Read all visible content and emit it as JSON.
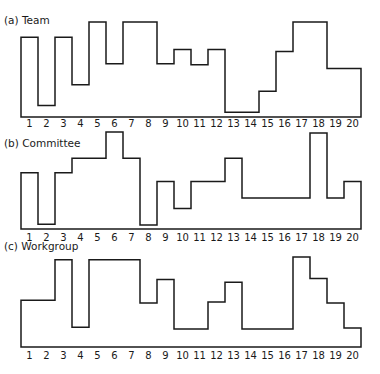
{
  "chart_data": [
    {
      "type": "bar",
      "style": "step-histogram",
      "title": "(a)  Team",
      "categories": [
        "1",
        "2",
        "3",
        "4",
        "5",
        "6",
        "7",
        "8",
        "9",
        "10",
        "11",
        "12",
        "13",
        "14",
        "15",
        "16",
        "17",
        "18",
        "19",
        "20"
      ],
      "values": [
        84,
        12,
        84,
        34,
        100,
        56,
        100,
        100,
        56,
        71,
        55,
        71,
        5,
        5,
        27,
        69,
        100,
        100,
        51,
        51
      ],
      "ylim": [
        0,
        100
      ],
      "xlabel": "",
      "ylabel": "",
      "grid": false,
      "layout": {
        "top": 22,
        "baseline": 117,
        "title_y": 24,
        "tick_y": 127
      }
    },
    {
      "type": "bar",
      "style": "step-histogram",
      "title": "(b)  Committee",
      "categories": [
        "1",
        "2",
        "3",
        "4",
        "5",
        "6",
        "7",
        "8",
        "9",
        "10",
        "11",
        "12",
        "13",
        "14",
        "15",
        "16",
        "17",
        "18",
        "19",
        "20"
      ],
      "values": [
        58,
        5,
        58,
        73,
        73,
        100,
        73,
        4,
        49,
        21,
        49,
        49,
        73,
        32,
        32,
        32,
        32,
        99,
        32,
        49
      ],
      "ylim": [
        0,
        100
      ],
      "xlabel": "",
      "ylabel": "",
      "grid": false,
      "layout": {
        "top": 132,
        "baseline": 229,
        "title_y": 147,
        "tick_y": 241
      }
    },
    {
      "type": "bar",
      "style": "step-histogram",
      "title": "(c)  Workgroup",
      "categories": [
        "1",
        "2",
        "3",
        "4",
        "5",
        "6",
        "7",
        "8",
        "9",
        "10",
        "11",
        "12",
        "13",
        "14",
        "15",
        "16",
        "17",
        "18",
        "19",
        "20"
      ],
      "values": [
        52,
        52,
        97,
        22,
        97,
        97,
        97,
        49,
        75,
        20,
        20,
        50,
        72,
        20,
        20,
        20,
        100,
        76,
        49,
        21
      ],
      "ylim": [
        0,
        100
      ],
      "xlabel": "",
      "ylabel": "",
      "grid": false,
      "layout": {
        "top": 257,
        "baseline": 347,
        "title_y": 250,
        "tick_y": 359
      }
    }
  ],
  "figure": {
    "x_left": 21,
    "bin_width": 17,
    "line_color": "#1a1a1a"
  }
}
